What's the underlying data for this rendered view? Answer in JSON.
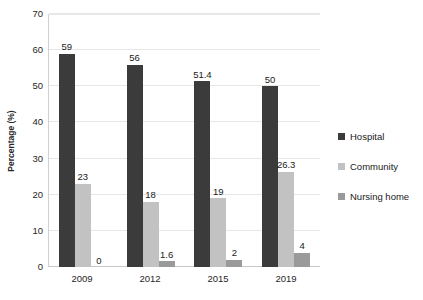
{
  "chart_data": {
    "type": "bar",
    "title": "",
    "xlabel": "",
    "ylabel": "Percentage (%)",
    "categories": [
      "2009",
      "2012",
      "2015",
      "2019"
    ],
    "series": [
      {
        "name": "Hospital",
        "color": "#3b3b3b",
        "values": [
          59,
          56,
          51.4,
          50
        ],
        "labels": [
          "59",
          "56",
          "51.4",
          "50"
        ]
      },
      {
        "name": "Community",
        "color": "#c2c2c2",
        "values": [
          23,
          18,
          19,
          26.3
        ],
        "labels": [
          "23",
          "18",
          "19",
          "26.3"
        ]
      },
      {
        "name": "Nursing home",
        "color": "#9a9a9a",
        "values": [
          0,
          1.6,
          2,
          4
        ],
        "labels": [
          "0",
          "1.6",
          "2",
          "4"
        ]
      }
    ],
    "ylim": [
      0,
      70
    ],
    "yticks": [
      0,
      10,
      20,
      30,
      40,
      50,
      60,
      70
    ],
    "ytick_labels": [
      "0",
      "10",
      "20",
      "30",
      "40",
      "50",
      "60",
      "70"
    ],
    "grid": true,
    "legend_position": "right",
    "data_labels": true
  }
}
